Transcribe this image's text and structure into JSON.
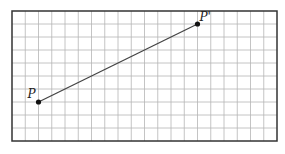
{
  "figure": {
    "grid": {
      "columns": 20,
      "rows": 10,
      "line_color": "#b5b5b5",
      "border_color": "#333333"
    },
    "points": [
      {
        "label": "P",
        "col": 2,
        "row": 7
      },
      {
        "label": "P'",
        "col": 14,
        "row": 1
      }
    ],
    "segment": {
      "from": "P",
      "to": "P'",
      "color": "#444444"
    }
  }
}
